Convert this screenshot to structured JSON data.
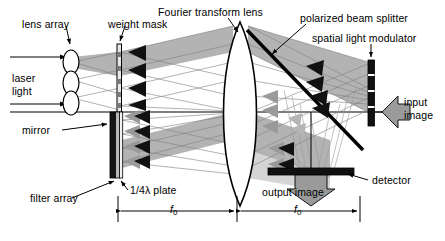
{
  "figure": {
    "background_color": "#ffffff",
    "line_color": "#000000",
    "beam_fill_color": "#b3b3b3",
    "beam_fill_color_light": "#cccccc",
    "component_dark_color": "#1a1a1a",
    "arrow_gray_color": "#999999"
  },
  "labels": {
    "lens_array": "lens array",
    "weight_mask": "weight mask",
    "fourier_transform_lens": "Fourier transform lens",
    "polarized_beam_splitter": "polarized beam splitter",
    "spatial_light_modulator": "spatial light modulator",
    "input_image_line1": "input",
    "input_image_line2": "image",
    "laser_light_line1": "laser",
    "laser_light_line2": "light",
    "mirror": "mirror",
    "quarter_wave_plate": "1/4λ plate",
    "filter_array": "filter array",
    "detector": "detector",
    "output_image": "output image",
    "focal_length_1": "f",
    "focal_length_1_sub": "0",
    "focal_length_2": "f",
    "focal_length_2_sub": "0"
  },
  "components": [
    {
      "name": "lens-array",
      "type": "lens-stack",
      "count": 3,
      "label": "lens array"
    },
    {
      "name": "weight-mask",
      "type": "vertical-plate",
      "label": "weight mask"
    },
    {
      "name": "fourier-transform-lens",
      "type": "biconvex-lens",
      "label": "Fourier transform lens"
    },
    {
      "name": "polarized-beam-splitter",
      "type": "diagonal-plate",
      "label": "polarized beam splitter"
    },
    {
      "name": "spatial-light-modulator",
      "type": "vertical-bar",
      "label": "spatial light modulator"
    },
    {
      "name": "mirror",
      "type": "vertical-bar",
      "label": "mirror"
    },
    {
      "name": "quarter-wave-plate",
      "type": "vertical-plate",
      "label": "1/4λ plate"
    },
    {
      "name": "filter-array",
      "type": "vertical-plate",
      "label": "filter array"
    },
    {
      "name": "detector",
      "type": "horizontal-bar",
      "label": "detector"
    }
  ],
  "dimensions": [
    {
      "name": "f0-left",
      "label": "f",
      "subscript": "0",
      "from_x": 118,
      "to_x": 237
    },
    {
      "name": "f0-right",
      "label": "f",
      "subscript": "0",
      "from_x": 241,
      "to_x": 360
    }
  ]
}
